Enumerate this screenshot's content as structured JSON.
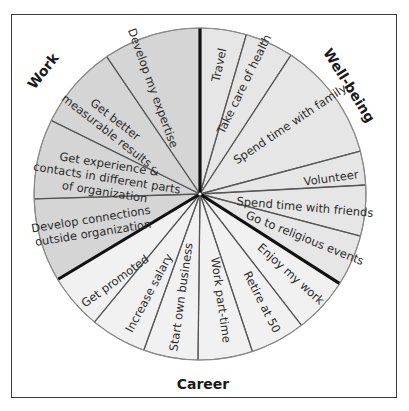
{
  "diagram": {
    "type": "wheel",
    "center": [
      200,
      194
    ],
    "radius": 166,
    "colors": {
      "work": "#d5d5d5",
      "well_being": "#e6e6e6",
      "career": "#f1f1f1",
      "spoke": "#555555",
      "divider": "#111111",
      "rim": "#8a8a8a"
    },
    "categories": [
      {
        "key": "work",
        "label": "Work",
        "label_pos": [
          47,
          74
        ],
        "label_rotate": -52
      },
      {
        "key": "well_being",
        "label": "Well-being",
        "label_pos": [
          345,
          88
        ],
        "label_rotate": 58
      },
      {
        "key": "career",
        "label": "Career",
        "label_pos": [
          203,
          389
        ],
        "label_rotate": 0
      }
    ],
    "segments": [
      {
        "label": [
          "Travel"
        ],
        "category": "well_being",
        "start": -90,
        "end": -73.8,
        "text_pos": [
          219,
          65
        ],
        "text_rotate": -78
      },
      {
        "label": [
          "Take care of health"
        ],
        "category": "well_being",
        "start": -73.8,
        "end": -56.8,
        "text_pos": [
          244,
          84
        ],
        "text_rotate": -64
      },
      {
        "label": [
          "Spend time with family"
        ],
        "category": "well_being",
        "start": -56.8,
        "end": -15,
        "text_pos": [
          290,
          124
        ],
        "text_rotate": -34
      },
      {
        "label": [
          "Volunteer"
        ],
        "category": "well_being",
        "start": -15,
        "end": -3.1,
        "text_pos": [
          331,
          178
        ],
        "text_rotate": -8
      },
      {
        "label": [
          "Spend time with friends"
        ],
        "category": "well_being",
        "start": -3.1,
        "end": 14.7,
        "text_pos": [
          305,
          207
        ],
        "text_rotate": 5
      },
      {
        "label": [
          "Go to religious events"
        ],
        "category": "well_being",
        "start": 14.7,
        "end": 32.7,
        "text_pos": [
          305,
          238
        ],
        "text_rotate": 22
      },
      {
        "label": [
          "Enjoy my work"
        ],
        "category": "career",
        "start": 32.7,
        "end": 52.3,
        "text_pos": [
          291,
          274
        ],
        "text_rotate": 42
      },
      {
        "label": [
          "Retire at 50"
        ],
        "category": "career",
        "start": 52.3,
        "end": 71.6,
        "text_pos": [
          262,
          302
        ],
        "text_rotate": 63
      },
      {
        "label": [
          "Work part-time"
        ],
        "category": "career",
        "start": 71.6,
        "end": 90.7,
        "text_pos": [
          221,
          300
        ],
        "text_rotate": 82
      },
      {
        "label": [
          "Start own business"
        ],
        "category": "career",
        "start": 90.7,
        "end": 109.8,
        "text_pos": [
          181,
          297
        ],
        "text_rotate": -82
      },
      {
        "label": [
          "Increase salary"
        ],
        "category": "career",
        "start": 109.8,
        "end": 129.5,
        "text_pos": [
          149,
          293
        ],
        "text_rotate": -62
      },
      {
        "label": [
          "Get promoted"
        ],
        "category": "career",
        "start": 129.5,
        "end": 149,
        "text_pos": [
          115,
          281
        ],
        "text_rotate": -36
      },
      {
        "label": [
          "Develop connections",
          "outside organization"
        ],
        "category": "work",
        "start": 149,
        "end": 178.3,
        "text_pos": [
          92,
          226
        ],
        "text_rotate": -9
      },
      {
        "label": [
          "Get experience &",
          "contacts in different parts",
          "of organization"
        ],
        "category": "work",
        "start": 178.3,
        "end": 206.3,
        "text_pos": [
          107,
          178
        ],
        "text_rotate": 9
      },
      {
        "label": [
          "Get better",
          "measurable results"
        ],
        "category": "work",
        "start": 206.3,
        "end": 235.8,
        "text_pos": [
          111,
          125
        ],
        "text_rotate": 38
      },
      {
        "label": [
          "Develop my expertise"
        ],
        "category": "work",
        "start": 235.8,
        "end": 270,
        "text_pos": [
          153,
          88
        ],
        "text_rotate": 70
      }
    ],
    "dividers": [
      -90,
      32.7,
      149
    ]
  }
}
